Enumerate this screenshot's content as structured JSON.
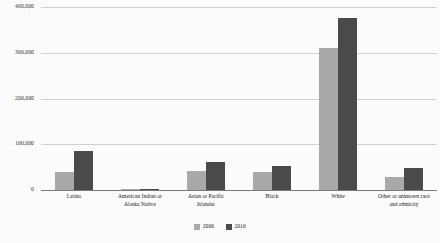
{
  "chart_data": {
    "type": "bar",
    "title": "",
    "subtitle": "",
    "xlabel": "",
    "ylabel": "",
    "ylim": [
      0,
      400000
    ],
    "grid": true,
    "legend_position": "bottom-center",
    "ytick_labels": [
      "400,000",
      "300,000",
      "200,000",
      "100,000",
      "0"
    ],
    "ytick_values": [
      400000,
      300000,
      200000,
      100000,
      0
    ],
    "categories": [
      "Latino",
      "American Indian or Alaska Native",
      "Asian or Pacific Islander",
      "Black",
      "White",
      "Other or unknown race and ethnicity"
    ],
    "category_label_lines": [
      [
        "Latino"
      ],
      [
        "American Indian or",
        "Alaska Native"
      ],
      [
        "Asian or Pacific",
        "Islander"
      ],
      [
        "Black"
      ],
      [
        "White"
      ],
      [
        "Other or unknown race",
        "and ethnicity"
      ]
    ],
    "series": [
      {
        "name": "2006",
        "color": "#a9a9a9",
        "values": [
          40000,
          3000,
          42000,
          40000,
          310000,
          28000
        ]
      },
      {
        "name": "2016",
        "color": "#4a4a4a",
        "values": [
          85000,
          3000,
          62000,
          52000,
          375000,
          48000
        ]
      }
    ]
  },
  "legend": {
    "items": [
      {
        "label": "2006",
        "color": "#a9a9a9"
      },
      {
        "label": "2016",
        "color": "#4a4a4a"
      }
    ]
  },
  "colors": {
    "series_2006": "#a9a9a9",
    "series_2016": "#4a4a4a",
    "gridline": "#cfcfcf",
    "axis": "#7a7a7a",
    "background": "#fbfbfb",
    "text": "#222222"
  }
}
